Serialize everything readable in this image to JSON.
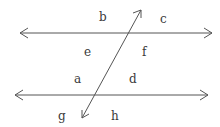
{
  "diagram": {
    "type": "parallel lines cut by a transversal",
    "line_color": "#555555",
    "label_color": "#3a3a3a",
    "lines": [
      {
        "name": "top-parallel-line",
        "x1": 20,
        "y1": 33,
        "x2": 212,
        "y2": 33
      },
      {
        "name": "bottom-parallel-line",
        "x1": 15,
        "y1": 95,
        "x2": 208,
        "y2": 95
      },
      {
        "name": "transversal",
        "x1": 141,
        "y1": 10,
        "x2": 82,
        "y2": 118
      }
    ],
    "labels": {
      "b": "b",
      "c": "c",
      "e": "e",
      "f": "f",
      "a": "a",
      "d": "d",
      "g": "g",
      "h": "h"
    }
  }
}
